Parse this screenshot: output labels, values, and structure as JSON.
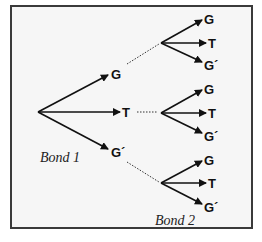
{
  "diagram": {
    "type": "tree",
    "root": "",
    "level1": [
      {
        "label": "G",
        "children": [
          "G",
          "T",
          "G´"
        ]
      },
      {
        "label": "T",
        "children": [
          "G",
          "T",
          "G´"
        ]
      },
      {
        "label": "G´",
        "children": [
          "G",
          "T",
          "G´"
        ]
      }
    ],
    "bond1_label": "Bond 1",
    "bond2_label": "Bond 2"
  }
}
